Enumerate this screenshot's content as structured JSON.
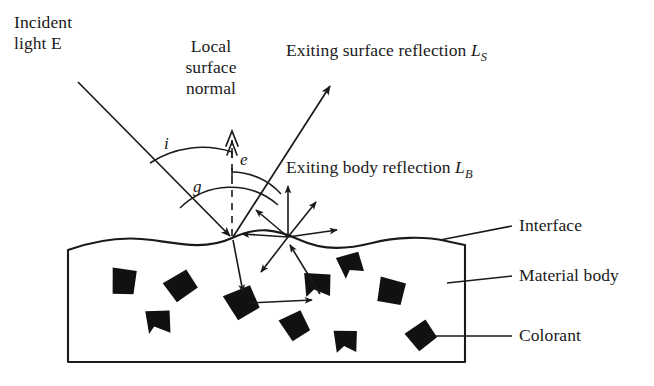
{
  "figure": {
    "background_color": "#ffffff",
    "ink_color": "#1a1a1a",
    "colorant_color": "#111111"
  },
  "labels": {
    "incident_light": {
      "line1": "Incident",
      "line2": "light E"
    },
    "local_surface_normal": {
      "line1": "Local",
      "line2": "surface",
      "line3": "normal"
    },
    "surface_reflection": {
      "text": "Exiting surface reflection ",
      "symbol": "L",
      "subscript": "S"
    },
    "body_reflection": {
      "text": "Exiting body reflection ",
      "symbol": "L",
      "subscript": "B"
    },
    "interface": "Interface",
    "material_body": "Material body",
    "colorant": "Colorant"
  },
  "angles": {
    "incidence": "i",
    "emittance": "e",
    "phase": "g"
  },
  "geometry": {
    "surface_hit_point": [
      232,
      238
    ],
    "body_scatter_hub": [
      288,
      237
    ],
    "incident_ray_start": [
      78,
      82
    ],
    "specular_ray_end": [
      331,
      84
    ],
    "normal_top": [
      232,
      132
    ],
    "body_left": 68,
    "body_right": 465,
    "body_top": 248,
    "body_bottom": 362
  },
  "colorants": [
    {
      "cx": 122,
      "cy": 281,
      "r": 15,
      "rot": 18
    },
    {
      "cx": 180,
      "cy": 286,
      "r": 16,
      "rot": -22
    },
    {
      "cx": 158,
      "cy": 321,
      "r": 14,
      "rot": 8
    },
    {
      "cx": 241,
      "cy": 303,
      "r": 17,
      "rot": -14
    },
    {
      "cx": 317,
      "cy": 285,
      "r": 16,
      "rot": 12
    },
    {
      "cx": 350,
      "cy": 265,
      "r": 14,
      "rot": -8
    },
    {
      "cx": 390,
      "cy": 291,
      "r": 16,
      "rot": 22
    },
    {
      "cx": 294,
      "cy": 326,
      "r": 15,
      "rot": -18
    },
    {
      "cx": 345,
      "cy": 341,
      "r": 14,
      "rot": 10
    },
    {
      "cx": 421,
      "cy": 336,
      "r": 15,
      "rot": -25
    }
  ],
  "scatter_rays": [
    {
      "angle": 180,
      "length": 47
    },
    {
      "angle": 140,
      "length": 42
    },
    {
      "angle": 90,
      "length": 52
    },
    {
      "angle": 52,
      "length": 45
    },
    {
      "angle": 8,
      "length": 50
    },
    {
      "angle": 232,
      "length": 44
    }
  ]
}
